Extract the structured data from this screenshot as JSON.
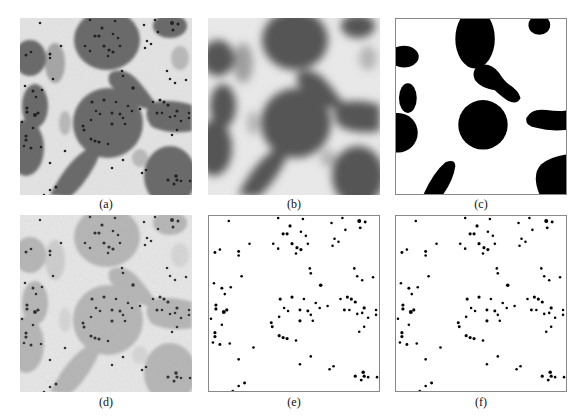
{
  "figure": {
    "panels": [
      {
        "id": "a",
        "label": "(a)",
        "kind": "micrograph-original"
      },
      {
        "id": "b",
        "label": "(b)",
        "kind": "micrograph-blurred"
      },
      {
        "id": "c",
        "label": "(c)",
        "kind": "binary-segmentation"
      },
      {
        "id": "d",
        "label": "(d)",
        "kind": "micrograph-background-removed"
      },
      {
        "id": "e",
        "label": "(e)",
        "kind": "detected-particles"
      },
      {
        "id": "f",
        "label": "(f)",
        "kind": "detected-particles-filtered"
      }
    ]
  }
}
